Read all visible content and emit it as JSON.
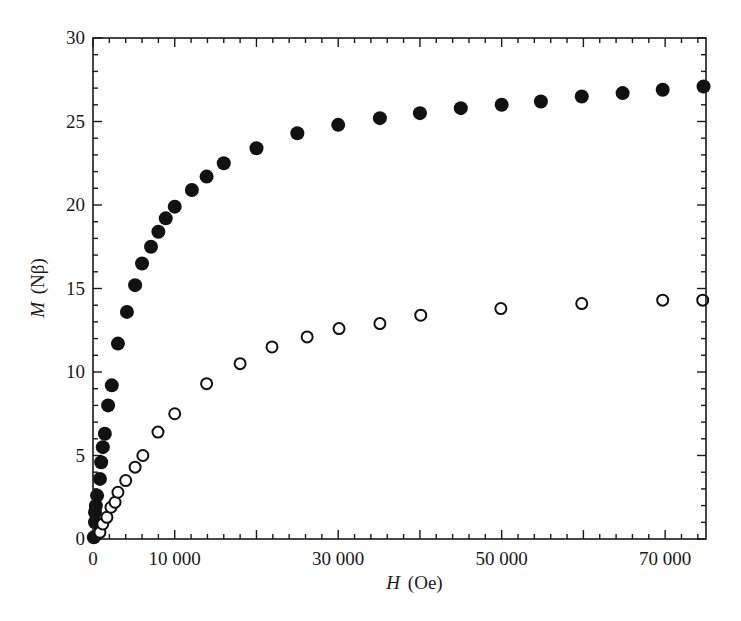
{
  "chart_data": {
    "type": "scatter",
    "title": "",
    "xlabel": "H (Oe)",
    "xlabel_var": "H",
    "xlabel_unit": "(Oe)",
    "ylabel": "M (Nβ)",
    "ylabel_var": "M",
    "ylabel_unit": "(Nβ)",
    "xlim": [
      0,
      75000
    ],
    "ylim": [
      0,
      30
    ],
    "grid": false,
    "legend": null,
    "x_ticks": {
      "major_values": [
        0,
        10000,
        20000,
        30000,
        40000,
        50000,
        60000,
        70000
      ],
      "minor_step": 2000,
      "labels": [
        {
          "value": 0,
          "text": "0"
        },
        {
          "value": 10000,
          "text": "10 000"
        },
        {
          "value": 30000,
          "text": "30 000"
        },
        {
          "value": 50000,
          "text": "50 000"
        },
        {
          "value": 70000,
          "text": "70 000"
        }
      ]
    },
    "y_ticks": {
      "major_values": [
        0,
        5,
        10,
        15,
        20,
        25,
        30
      ],
      "minor_step": 1,
      "labels": [
        {
          "value": 0,
          "text": "0"
        },
        {
          "value": 5,
          "text": "5"
        },
        {
          "value": 10,
          "text": "10"
        },
        {
          "value": 15,
          "text": "15"
        },
        {
          "value": 20,
          "text": "20"
        },
        {
          "value": 25,
          "text": "25"
        },
        {
          "value": 30,
          "text": "30"
        }
      ]
    },
    "series": [
      {
        "name": "filled circles",
        "marker": "filled-circle",
        "color": "#111111",
        "x": [
          100,
          250,
          250,
          350,
          500,
          850,
          1000,
          1200,
          1450,
          1850,
          2300,
          3050,
          4150,
          5150,
          6000,
          7100,
          8000,
          8900,
          10000,
          12100,
          13900,
          16000,
          20000,
          25000,
          30000,
          35100,
          40000,
          45000,
          50000,
          54800,
          59800,
          64800,
          69700,
          74700
        ],
        "y": [
          0.1,
          1.0,
          1.6,
          2.0,
          2.6,
          3.6,
          4.6,
          5.5,
          6.3,
          8.0,
          9.2,
          11.7,
          13.6,
          15.2,
          16.5,
          17.5,
          18.4,
          19.2,
          19.9,
          20.9,
          21.7,
          22.5,
          23.4,
          24.3,
          24.8,
          25.2,
          25.5,
          25.8,
          26.0,
          26.2,
          26.5,
          26.7,
          26.9,
          27.1
        ]
      },
      {
        "name": "open circles",
        "marker": "open-circle",
        "color": "#111111",
        "x": [
          850,
          1200,
          1700,
          2200,
          2700,
          3050,
          4000,
          5150,
          6100,
          7950,
          10000,
          13900,
          18000,
          21900,
          26200,
          30100,
          35100,
          40100,
          49900,
          59800,
          69700,
          74600
        ],
        "y": [
          0.4,
          0.9,
          1.3,
          1.9,
          2.2,
          2.8,
          3.5,
          4.3,
          5.0,
          6.4,
          7.5,
          9.3,
          10.5,
          11.5,
          12.1,
          12.6,
          12.9,
          13.4,
          13.8,
          14.1,
          14.3,
          14.3
        ]
      }
    ]
  },
  "layout": {
    "plot_left": 93,
    "plot_top": 38,
    "plot_right": 706,
    "plot_bottom": 539
  }
}
